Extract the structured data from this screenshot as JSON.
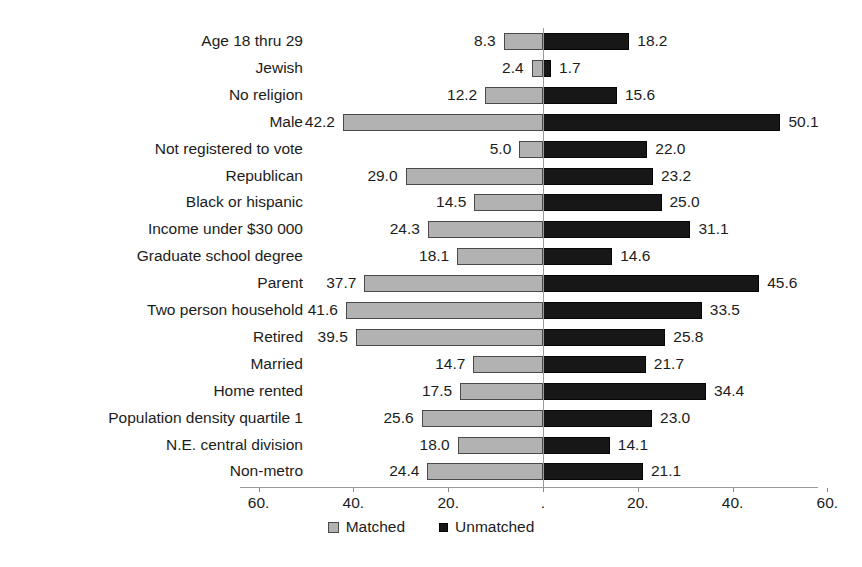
{
  "chart_data": {
    "type": "bar",
    "orientation": "horizontal",
    "layout": "diverging-bidirectional",
    "title": "",
    "subtitle": "",
    "xlabel": "",
    "ylabel": "",
    "grid": false,
    "legend_position": "bottom-center",
    "xlim": [
      -60,
      60
    ],
    "axis_ticks": [
      {
        "label": "60.",
        "value": -60
      },
      {
        "label": "40.",
        "value": -40
      },
      {
        "label": "20.",
        "value": -20
      },
      {
        "label": ".",
        "value": 0
      },
      {
        "label": "20.",
        "value": 20
      },
      {
        "label": "40.",
        "value": 40
      },
      {
        "label": "60.",
        "value": 60
      }
    ],
    "categories": [
      "Age 18 thru 29",
      "Jewish",
      "No religion",
      "Male",
      "Not registered to vote",
      "Republican",
      "Black or hispanic",
      "Income under $30 000",
      "Graduate school degree",
      "Parent",
      "Two person household",
      "Retired",
      "Married",
      "Home rented",
      "Population density quartile 1",
      "N.E. central division",
      "Non-metro"
    ],
    "series": [
      {
        "name": "Matched",
        "color": "#b2b2b2",
        "direction": "left",
        "values": [
          8.3,
          2.4,
          12.2,
          42.2,
          5.0,
          29.0,
          14.5,
          24.3,
          18.1,
          37.7,
          41.6,
          39.5,
          14.7,
          17.5,
          25.6,
          18.0,
          24.4
        ],
        "labels": [
          "8.3",
          "2.4",
          "12.2",
          "42.2",
          "5.0",
          "29.0",
          "14.5",
          "24.3",
          "18.1",
          "37.7",
          "41.6",
          "39.5",
          "14.7",
          "17.5",
          "25.6",
          "18.0",
          "24.4"
        ]
      },
      {
        "name": "Unmatched",
        "color": "#171717",
        "direction": "right",
        "values": [
          18.2,
          1.7,
          15.6,
          50.1,
          22.0,
          23.2,
          25.0,
          31.1,
          14.6,
          45.6,
          33.5,
          25.8,
          21.7,
          34.4,
          23.0,
          14.1,
          21.1
        ],
        "labels": [
          "18.2",
          "1.7",
          "15.6",
          "50.1",
          "22.0",
          "23.2",
          "25.0",
          "31.1",
          "14.6",
          "45.6",
          "33.5",
          "25.8",
          "21.7",
          "34.4",
          "23.0",
          "14.1",
          "21.1"
        ]
      }
    ]
  },
  "legend": {
    "items": [
      {
        "label": "Matched",
        "swatch": "matched-swatch-icon"
      },
      {
        "label": "Unmatched",
        "swatch": "unmatched-swatch-icon"
      }
    ]
  },
  "colors": {
    "matched": "#b2b2b2",
    "unmatched": "#171717",
    "axis": "#9a9a9a",
    "text": "#1c1c1c",
    "background": "#ffffff"
  }
}
